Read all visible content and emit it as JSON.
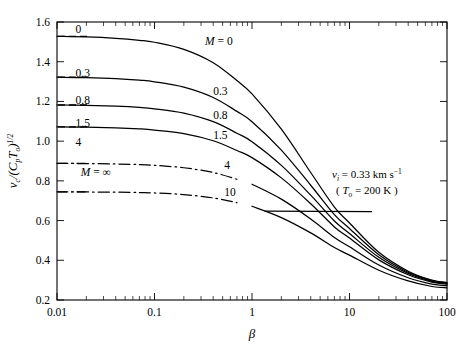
{
  "figure": {
    "background": "#ffffff",
    "line_color": "#000000"
  },
  "axes": {
    "x_title": "β",
    "y_title_parts": {
      "num": "v",
      "num_sub": "c",
      "den_open": "/(C",
      "den_sub": "p",
      "den_mid": "T",
      "den_sub2": "o",
      "den_close": ")",
      "exp": "1/2"
    },
    "x_tick_labels": [
      "0.01",
      "0.1",
      "1",
      "10",
      "100"
    ],
    "x_tick_values": [
      0.01,
      0.1,
      1,
      10,
      100
    ],
    "y_tick_labels": [
      "0.2",
      "0.4",
      "0.6",
      "0.8",
      "1.0",
      "1.2",
      "1.4",
      "1.6"
    ],
    "y_tick_values": [
      0.2,
      0.4,
      0.6,
      0.8,
      1.0,
      1.2,
      1.4,
      1.6
    ],
    "x_scale": "log",
    "y_scale": "linear",
    "xlim": [
      0.01,
      100
    ],
    "ylim": [
      0.2,
      1.6
    ],
    "grid": false,
    "ticks_direction": "in",
    "minor_ticks": true,
    "frame": "box"
  },
  "annotations": {
    "velocity": {
      "var": "v",
      "sub": "i",
      "eq": " = 0.33 km s",
      "exp": "−1"
    },
    "temperature": {
      "open": "( ",
      "var": "T",
      "sub": "o",
      "eq": " = 200 K )"
    }
  },
  "curve_labels_left": [
    {
      "text": "0",
      "x": 0.0155,
      "y": 1.565
    },
    {
      "text": "0.3",
      "x": 0.0155,
      "y": 1.345
    },
    {
      "text": "0.8",
      "x": 0.0155,
      "y": 1.205
    },
    {
      "text": "1.5",
      "x": 0.0155,
      "y": 1.092
    },
    {
      "text": "4",
      "x": 0.0155,
      "y": 0.998
    },
    {
      "text": "M = ∞",
      "x": 0.0175,
      "y": 0.845,
      "italic_head": true
    }
  ],
  "curve_labels_inner": [
    {
      "text": "M = 0",
      "x": 0.33,
      "y": 1.505,
      "italic_head": true
    },
    {
      "text": "0.3",
      "x": 0.4,
      "y": 1.255
    },
    {
      "text": "0.8",
      "x": 0.4,
      "y": 1.133
    },
    {
      "text": "1.5",
      "x": 0.4,
      "y": 1.033
    },
    {
      "text": "4",
      "x": 0.52,
      "y": 0.878
    },
    {
      "text": "10",
      "x": 0.52,
      "y": 0.745
    }
  ],
  "chart_data": {
    "type": "line",
    "title": "",
    "xlabel": "β",
    "ylabel": "v_c/(C_p T_o)^{1/2}",
    "xscale": "log",
    "xlim": [
      0.01,
      100
    ],
    "ylim": [
      0.2,
      1.6
    ],
    "xticks": [
      0.01,
      0.1,
      1,
      10,
      100
    ],
    "yticks": [
      0.2,
      0.4,
      0.6,
      0.8,
      1.0,
      1.2,
      1.4,
      1.6
    ],
    "legend": "inline-labels",
    "legend_position": "inside-plot",
    "annotations": [
      "v_i = 0.33 km s^-1",
      "(T_o = 200 K)"
    ],
    "x": [
      0.01,
      0.02,
      0.04,
      0.07,
      0.1,
      0.2,
      0.4,
      0.7,
      1.0,
      2.0,
      4.0,
      7.0,
      10.0,
      20.0,
      40.0,
      70.0,
      100.0
    ],
    "series": [
      {
        "name": "M = 0",
        "style": "solid",
        "asymptote": 1.528,
        "values": [
          1.528,
          1.525,
          1.518,
          1.508,
          1.498,
          1.462,
          1.395,
          1.305,
          1.238,
          1.06,
          0.842,
          0.668,
          0.588,
          0.44,
          0.345,
          0.3,
          0.288
        ]
      },
      {
        "name": "M = 0.3",
        "style": "solid",
        "asymptote": 1.322,
        "values": [
          1.322,
          1.32,
          1.315,
          1.307,
          1.299,
          1.272,
          1.22,
          1.15,
          1.098,
          0.955,
          0.778,
          0.63,
          0.56,
          0.428,
          0.34,
          0.298,
          0.286
        ]
      },
      {
        "name": "M = 0.8",
        "style": "solid",
        "asymptote": 1.182,
        "values": [
          1.182,
          1.18,
          1.176,
          1.17,
          1.163,
          1.141,
          1.098,
          1.04,
          0.997,
          0.878,
          0.728,
          0.598,
          0.535,
          0.415,
          0.334,
          0.294,
          0.283
        ]
      },
      {
        "name": "M = 1.5",
        "style": "solid",
        "asymptote": 1.072,
        "values": [
          1.072,
          1.07,
          1.067,
          1.062,
          1.056,
          1.038,
          1.002,
          0.953,
          0.917,
          0.815,
          0.685,
          0.568,
          0.512,
          0.402,
          0.327,
          0.29,
          0.28
        ]
      },
      {
        "name": "M = 4",
        "style": "dashdot",
        "asymptote": 0.888,
        "values": [
          0.888,
          0.887,
          0.885,
          0.882,
          0.878,
          0.866,
          0.842,
          0.808,
          0.783,
          0.708,
          0.608,
          0.515,
          0.468,
          0.376,
          0.312,
          0.28,
          0.272
        ]
      },
      {
        "name": "M = 10",
        "style": "dashdot",
        "asymptote": 0.745,
        "values": [
          0.745,
          0.744,
          0.743,
          0.741,
          0.739,
          0.731,
          0.714,
          0.69,
          0.672,
          0.615,
          0.538,
          0.464,
          0.426,
          0.35,
          0.296,
          0.268,
          0.261
        ]
      }
    ],
    "asymptote_lines": [
      {
        "name": "M = 0 asymptote",
        "y": 1.528,
        "style": "dashed"
      },
      {
        "name": "M = 0.3 asymptote",
        "y": 1.322,
        "style": "dashed"
      },
      {
        "name": "M = 0.8 asymptote",
        "y": 1.182,
        "style": "dashed"
      },
      {
        "name": "M = 1.5 asymptote",
        "y": 1.072,
        "style": "dashed"
      },
      {
        "name": "M = 4 asymptote",
        "y": 0.888,
        "style": "dashed"
      },
      {
        "name": "M = inf asymptote",
        "y": 0.745,
        "style": "dashed"
      }
    ]
  }
}
